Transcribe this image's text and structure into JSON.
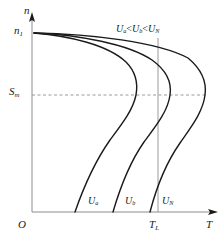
{
  "figure": {
    "kind": "motor-speed-torque-characteristic",
    "background_color": "#ffffff",
    "line_color": "#1a1a1a",
    "axis_color": "#808080",
    "dash_color": "#999999"
  },
  "axes": {
    "y_axis_label": "n",
    "x_axis_label": "T",
    "origin_label": "O",
    "n1_label": "n",
    "n1_sub": "1",
    "sm_label": "S",
    "sm_sub": "m",
    "tl_label": "T",
    "tl_sub": "L"
  },
  "annotations": {
    "inequality_u": "U",
    "inequality_sub_a": "a",
    "inequality_lt1": "<",
    "inequality_sub_b": "b",
    "inequality_lt2": "<",
    "inequality_sub_n": "N",
    "inequality_text": "Ua<Ub<UN"
  },
  "curves": [
    {
      "id": "a",
      "label_u": "U",
      "label_sub": "a"
    },
    {
      "id": "b",
      "label_u": "U",
      "label_sub": "b"
    },
    {
      "id": "N",
      "label_u": "U",
      "label_sub": "N"
    }
  ],
  "chart_data": {
    "type": "line",
    "title": "",
    "xlabel": "T",
    "ylabel": "n",
    "grid": false,
    "legend": "inline-curve-labels",
    "x_range_px": [
      32,
      215
    ],
    "y_range_px": [
      33,
      212
    ],
    "reference_lines": [
      {
        "name": "S_m",
        "orientation": "horizontal",
        "style": "dashed",
        "y_px": 95,
        "x_from_px": 32,
        "x_to_px": 207,
        "label": "Sm"
      },
      {
        "name": "T_L",
        "orientation": "vertical",
        "style": "solid",
        "x_px": 158,
        "y_from_px": 38,
        "y_to_px": 212,
        "label": "TL"
      }
    ],
    "series": [
      {
        "name": "Ua",
        "start_point_px": [
          34,
          33
        ],
        "peak_point_px": [
          136,
          95
        ],
        "end_point_px": [
          75,
          212
        ],
        "path": "M34,33 C70,36 108,45 126,62 C136,72 138,84 136,95 C133,110 122,124 110,140 C96,160 84,186 75,212"
      },
      {
        "name": "Ub",
        "start_point_px": [
          34,
          33
        ],
        "peak_point_px": [
          170,
          95
        ],
        "end_point_px": [
          113,
          212
        ],
        "path": "M34,33 C80,35 128,44 152,60 C166,70 172,82 170,95 C168,111 156,126 144,142 C130,162 120,188 113,212"
      },
      {
        "name": "UN",
        "start_point_px": [
          34,
          33
        ],
        "peak_point_px": [
          205,
          95
        ],
        "end_point_px": [
          150,
          212
        ],
        "path": "M34,33 C92,34 158,42 188,58 C200,68 207,81 205,95 C203,112 191,127 180,143 C166,163 156,189 150,212"
      }
    ]
  }
}
